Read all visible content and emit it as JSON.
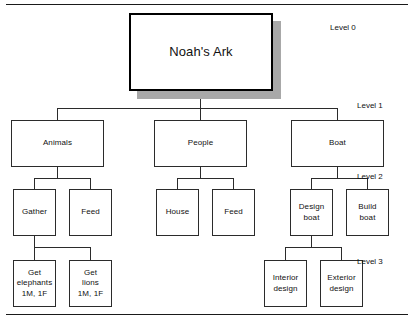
{
  "diagram": {
    "root": {
      "label": "Noah's Ark"
    },
    "level_labels": [
      {
        "text": "Level 0"
      },
      {
        "text": "Level 1"
      },
      {
        "text": "Level 2"
      },
      {
        "text": "Level 3"
      }
    ],
    "level1": [
      {
        "label": "Animals"
      },
      {
        "label": "People"
      },
      {
        "label": "Boat"
      }
    ],
    "level2": [
      {
        "label": "Gather"
      },
      {
        "label": "Feed"
      },
      {
        "label": "House"
      },
      {
        "label": "Feed"
      },
      {
        "label": "Design\nboat"
      },
      {
        "label": "Build\nboat"
      }
    ],
    "level3": [
      {
        "label": "Get\nelephants\n1M, 1F"
      },
      {
        "label": "Get\nlions\n1M, 1F"
      },
      {
        "label": "Interior\ndesign"
      },
      {
        "label": "Exterior\ndesign"
      }
    ],
    "colors": {
      "box_border": "#2b2b2b",
      "root_border": "#000000",
      "shadow": "#a8a8a8",
      "text": "#111111",
      "rule": "#1a1a1a",
      "background": "#ffffff"
    }
  }
}
